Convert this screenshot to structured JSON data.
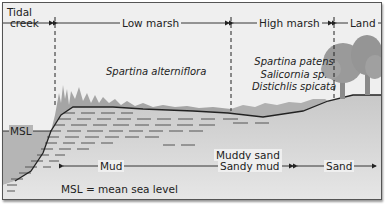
{
  "zones": [
    {
      "id": "tidal-creek",
      "label_line1": "Tidal",
      "label_line2": "creek"
    },
    {
      "id": "low-marsh",
      "label": "Low marsh"
    },
    {
      "id": "high-marsh",
      "label": "High marsh"
    },
    {
      "id": "land",
      "label": "Land"
    }
  ],
  "species": {
    "low_marsh": "Spartina alterniflora",
    "high_marsh": [
      "Spartina patens",
      "Salicornia sp.",
      "Distichlis spicata"
    ]
  },
  "sediments": [
    {
      "id": "mud",
      "label": "Mud"
    },
    {
      "id": "muddy-sand",
      "label_line1": "Muddy sand",
      "label_line2": "Sandy mud"
    },
    {
      "id": "sand",
      "label": "Sand"
    }
  ],
  "msl_label": "MSL",
  "legend": "MSL = mean sea level",
  "colors": {
    "background": "#efefef",
    "water": "#b8b8b8",
    "sediment": "#d8d8d8",
    "grass": "#a0a0a0",
    "trees": "#909090",
    "line": "#222222"
  }
}
